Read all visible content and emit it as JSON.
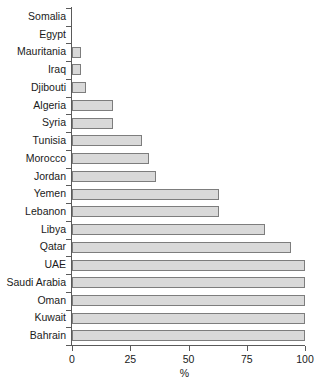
{
  "chart_data": {
    "type": "bar",
    "orientation": "horizontal",
    "title": "",
    "subtitle": "",
    "xlabel": "%",
    "ylabel": "",
    "xlim": [
      0,
      100
    ],
    "xticks": [
      0,
      25,
      50,
      75,
      100
    ],
    "xtick_labels": [
      "0",
      "25",
      "50",
      "75",
      "100"
    ],
    "grid": false,
    "legend": null,
    "categories": [
      "Somalia",
      "Egypt",
      "Mauritania",
      "Iraq",
      "Djibouti",
      "Algeria",
      "Syria",
      "Tunisia",
      "Morocco",
      "Jordan",
      "Yemen",
      "Lebanon",
      "Libya",
      "Qatar",
      "UAE",
      "Saudi Arabia",
      "Oman",
      "Kuwait",
      "Bahrain"
    ],
    "values": [
      0,
      0,
      4,
      4,
      6,
      17.5,
      17.5,
      30,
      33,
      36,
      63,
      63,
      83,
      94,
      100,
      100,
      100,
      100,
      100
    ],
    "bar_fill_color": "#d9d9d9",
    "bar_edge_color": "#7d7d7d",
    "axis_color": "#5a5a5a",
    "background_color": "#ffffff"
  }
}
